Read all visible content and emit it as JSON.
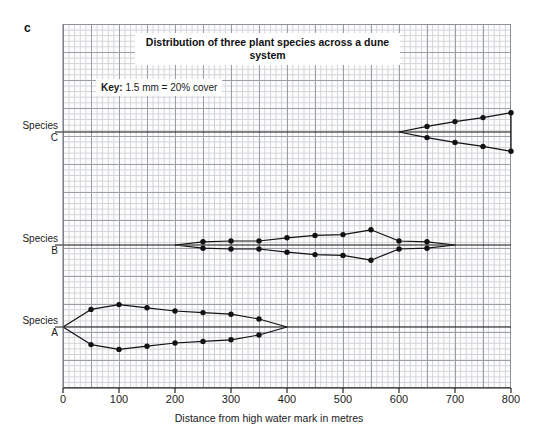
{
  "figure": {
    "part_label": "c",
    "title": "Distribution of three plant species across a dune system",
    "key": {
      "label": "Key:",
      "value": "1.5 mm = 20% cover"
    }
  },
  "axes": {
    "x_title": "Distance from high water mark in metres",
    "x_ticks": [
      "0",
      "100",
      "200",
      "300",
      "400",
      "500",
      "600",
      "700",
      "800"
    ],
    "species_labels": [
      {
        "name": "Species",
        "letter": "C"
      },
      {
        "name": "Species",
        "letter": "B"
      },
      {
        "name": "Species",
        "letter": "A"
      }
    ]
  },
  "chart_data": {
    "type": "area",
    "title": "Distribution of three plant species across a dune system",
    "subtitle": "Kite diagram",
    "xlabel": "Distance from high water mark in metres",
    "ylabel": "Percentage cover (kite width)",
    "xlim": [
      0,
      800
    ],
    "grid": true,
    "legend": "none",
    "annotations": [
      "Key: 1.5 mm = 20% cover",
      "c"
    ],
    "x": [
      0,
      50,
      100,
      150,
      200,
      250,
      300,
      350,
      400,
      450,
      500,
      550,
      600,
      650,
      700,
      750,
      800
    ],
    "series": [
      {
        "name": "Species A",
        "baseline_label": "Species A",
        "half_width_percent_cover": [
          0,
          22,
          28,
          24,
          20,
          18,
          16,
          10,
          0,
          0,
          0,
          0,
          0,
          0,
          0,
          0,
          0
        ]
      },
      {
        "name": "Species B",
        "baseline_label": "Species B",
        "half_width_percent_cover": [
          0,
          0,
          0,
          0,
          0,
          4,
          5,
          5,
          9,
          12,
          13,
          19,
          5,
          4,
          0,
          0,
          0
        ]
      },
      {
        "name": "Species C",
        "baseline_label": "Species C",
        "half_width_percent_cover": [
          0,
          0,
          0,
          0,
          0,
          0,
          0,
          0,
          0,
          0,
          0,
          0,
          0,
          7,
          13,
          18,
          24
        ]
      }
    ]
  }
}
